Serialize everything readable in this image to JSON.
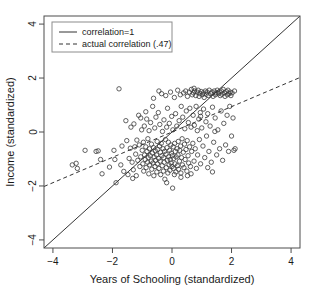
{
  "chart_data": {
    "type": "scatter",
    "title": "",
    "xlabel": "Years of Schooling (standardized)",
    "ylabel": "Income (standardized)",
    "xlim": [
      -4.3,
      4.3
    ],
    "ylim": [
      -4.3,
      4.3
    ],
    "xticks": [
      -4,
      -2,
      0,
      2,
      4
    ],
    "yticks": [
      -4,
      -2,
      0,
      2,
      4
    ],
    "xtick_labels": [
      "−4",
      "−2",
      "0",
      "2",
      "4"
    ],
    "ytick_labels": [
      "−4",
      "−2",
      "0",
      "2",
      "4"
    ],
    "grid": false,
    "legend_position": "top-left",
    "legend": [
      {
        "label": "correlation=1",
        "style": "solid"
      },
      {
        "label": "actual correlation (.47)",
        "style": "dashed"
      }
    ],
    "lines": [
      {
        "name": "correlation=1",
        "style": "solid",
        "slope": 1,
        "intercept": 0,
        "x": [
          -4.3,
          4.3
        ],
        "y": [
          -4.3,
          4.3
        ]
      },
      {
        "name": "actual correlation (.47)",
        "style": "dashed",
        "slope": 0.47,
        "intercept": 0,
        "x": [
          -4.3,
          4.3
        ],
        "y": [
          -2.02,
          2.02
        ]
      }
    ],
    "n_points": 252,
    "marker": "open-circle",
    "marker_color": "#3a3a3a",
    "points": [
      [
        -3.35,
        -1.22
      ],
      [
        -3.22,
        -1.16
      ],
      [
        -3.18,
        -1.35
      ],
      [
        -2.92,
        -0.68
      ],
      [
        -2.55,
        -0.72
      ],
      [
        -2.48,
        -0.7
      ],
      [
        -2.4,
        -1.02
      ],
      [
        -2.35,
        -1.55
      ],
      [
        -2.1,
        -1.3
      ],
      [
        -1.95,
        -0.68
      ],
      [
        -1.92,
        -1.02
      ],
      [
        -1.88,
        -1.88
      ],
      [
        -1.78,
        1.6
      ],
      [
        -1.72,
        -1.22
      ],
      [
        -1.68,
        -0.52
      ],
      [
        -1.62,
        -1.46
      ],
      [
        -1.55,
        0.42
      ],
      [
        -1.52,
        -0.32
      ],
      [
        -1.48,
        -1.58
      ],
      [
        -1.44,
        -0.98
      ],
      [
        -1.4,
        -0.6
      ],
      [
        -1.38,
        0.18
      ],
      [
        -1.34,
        -1.12
      ],
      [
        -1.3,
        -1.4
      ],
      [
        -1.28,
        0.3
      ],
      [
        -1.25,
        -0.55
      ],
      [
        -1.22,
        -0.82
      ],
      [
        -1.2,
        -1.62
      ],
      [
        -1.18,
        -0.3
      ],
      [
        -1.15,
        -1.05
      ],
      [
        -1.12,
        0.62
      ],
      [
        -1.1,
        -0.48
      ],
      [
        -1.08,
        -1.28
      ],
      [
        -1.05,
        -0.92
      ],
      [
        -1.02,
        0.08
      ],
      [
        -1.0,
        -0.68
      ],
      [
        -0.98,
        -1.18
      ],
      [
        -0.96,
        -0.38
      ],
      [
        -0.95,
        -1.45
      ],
      [
        -0.93,
        0.22
      ],
      [
        -0.92,
        -0.85
      ],
      [
        -0.9,
        -1.02
      ],
      [
        -0.88,
        -0.55
      ],
      [
        -0.87,
        -1.32
      ],
      [
        -0.85,
        0.48
      ],
      [
        -0.84,
        -0.72
      ],
      [
        -0.82,
        -1.12
      ],
      [
        -0.81,
        -0.25
      ],
      [
        -0.8,
        -0.95
      ],
      [
        -0.78,
        -1.55
      ],
      [
        -0.77,
        0.05
      ],
      [
        -0.76,
        -0.62
      ],
      [
        -0.75,
        -1.22
      ],
      [
        -0.73,
        -0.88
      ],
      [
        -0.72,
        0.35
      ],
      [
        -0.7,
        -1.08
      ],
      [
        -0.69,
        -0.45
      ],
      [
        -0.68,
        -1.38
      ],
      [
        -0.66,
        -0.78
      ],
      [
        -0.65,
        0.95
      ],
      [
        -0.64,
        -1.15
      ],
      [
        -0.62,
        -0.58
      ],
      [
        -0.61,
        -1.62
      ],
      [
        -0.6,
        -0.92
      ],
      [
        -0.58,
        0.15
      ],
      [
        -0.57,
        -1.28
      ],
      [
        -0.56,
        -0.7
      ],
      [
        -0.55,
        -1.05
      ],
      [
        -0.54,
        0.55
      ],
      [
        -0.52,
        -0.85
      ],
      [
        -0.51,
        -1.48
      ],
      [
        -0.5,
        -0.35
      ],
      [
        -0.49,
        -1.18
      ],
      [
        -0.48,
        -0.65
      ],
      [
        -0.46,
        0.72
      ],
      [
        -0.45,
        -0.98
      ],
      [
        -0.44,
        -1.35
      ],
      [
        -0.42,
        -0.52
      ],
      [
        -0.41,
        0.28
      ],
      [
        -0.4,
        -1.08
      ],
      [
        -0.39,
        -0.75
      ],
      [
        -0.38,
        -1.58
      ],
      [
        -0.36,
        -0.42
      ],
      [
        -0.35,
        1.42
      ],
      [
        -0.34,
        -0.88
      ],
      [
        -0.33,
        -1.25
      ],
      [
        -0.32,
        0.02
      ],
      [
        -0.3,
        -0.62
      ],
      [
        -0.29,
        -1.45
      ],
      [
        -0.28,
        -0.95
      ],
      [
        -0.27,
        0.45
      ],
      [
        -0.26,
        -1.12
      ],
      [
        -0.25,
        -0.72
      ],
      [
        -0.24,
        -1.75
      ],
      [
        -0.22,
        -0.28
      ],
      [
        -0.21,
        1.35
      ],
      [
        -0.2,
        -0.82
      ],
      [
        -0.19,
        -1.32
      ],
      [
        -0.18,
        0.18
      ],
      [
        -0.17,
        -0.58
      ],
      [
        -0.16,
        -1.05
      ],
      [
        -0.15,
        0.88
      ],
      [
        -0.14,
        -1.52
      ],
      [
        -0.12,
        -0.38
      ],
      [
        -0.11,
        -0.92
      ],
      [
        -0.1,
        -1.22
      ],
      [
        -0.09,
        0.32
      ],
      [
        -0.08,
        -0.68
      ],
      [
        -0.07,
        -1.42
      ],
      [
        -0.06,
        -1.02
      ],
      [
        -0.05,
        1.48
      ],
      [
        -0.04,
        -0.48
      ],
      [
        -0.03,
        -1.15
      ],
      [
        -0.02,
        -0.78
      ],
      [
        -0.01,
        0.58
      ],
      [
        0.0,
        -1.28
      ],
      [
        0.01,
        -0.88
      ],
      [
        0.02,
        -2.08
      ],
      [
        0.03,
        0.08
      ],
      [
        0.04,
        -0.55
      ],
      [
        0.05,
        -1.35
      ],
      [
        0.06,
        -0.98
      ],
      [
        0.08,
        1.28
      ],
      [
        0.09,
        -0.42
      ],
      [
        0.1,
        -1.18
      ],
      [
        0.11,
        -0.72
      ],
      [
        0.12,
        0.68
      ],
      [
        0.13,
        -1.48
      ],
      [
        0.14,
        -0.92
      ],
      [
        0.16,
        0.22
      ],
      [
        0.17,
        -0.62
      ],
      [
        0.18,
        -1.25
      ],
      [
        0.19,
        1.55
      ],
      [
        0.2,
        -0.85
      ],
      [
        0.21,
        -0.35
      ],
      [
        0.22,
        -1.38
      ],
      [
        0.24,
        0.42
      ],
      [
        0.25,
        -1.08
      ],
      [
        0.26,
        -0.68
      ],
      [
        0.28,
        1.38
      ],
      [
        0.29,
        -0.52
      ],
      [
        0.3,
        -1.52
      ],
      [
        0.31,
        0.95
      ],
      [
        0.32,
        -0.95
      ],
      [
        0.34,
        -0.25
      ],
      [
        0.35,
        -1.22
      ],
      [
        0.36,
        0.55
      ],
      [
        0.38,
        -0.75
      ],
      [
        0.39,
        1.45
      ],
      [
        0.4,
        -1.32
      ],
      [
        0.42,
        -0.45
      ],
      [
        0.43,
        0.12
      ],
      [
        0.44,
        -1.02
      ],
      [
        0.46,
        1.52
      ],
      [
        0.47,
        -0.65
      ],
      [
        0.48,
        0.78
      ],
      [
        0.5,
        -1.45
      ],
      [
        0.51,
        -0.32
      ],
      [
        0.52,
        1.32
      ],
      [
        0.54,
        -0.88
      ],
      [
        0.55,
        0.35
      ],
      [
        0.56,
        -1.15
      ],
      [
        0.58,
        1.48
      ],
      [
        0.59,
        -0.55
      ],
      [
        0.6,
        0.88
      ],
      [
        0.62,
        -1.28
      ],
      [
        0.64,
        0.18
      ],
      [
        0.65,
        1.58
      ],
      [
        0.66,
        -0.72
      ],
      [
        0.68,
        1.38
      ],
      [
        0.7,
        -0.42
      ],
      [
        0.71,
        0.62
      ],
      [
        0.72,
        1.45
      ],
      [
        0.74,
        -1.08
      ],
      [
        0.75,
        0.25
      ],
      [
        0.76,
        1.52
      ],
      [
        0.78,
        -0.62
      ],
      [
        0.8,
        1.35
      ],
      [
        0.81,
        0.95
      ],
      [
        0.82,
        -1.35
      ],
      [
        0.84,
        1.48
      ],
      [
        0.85,
        0.05
      ],
      [
        0.86,
        -0.85
      ],
      [
        0.88,
        1.55
      ],
      [
        0.9,
        0.48
      ],
      [
        0.91,
        1.32
      ],
      [
        0.92,
        -0.28
      ],
      [
        0.94,
        1.42
      ],
      [
        0.95,
        0.72
      ],
      [
        0.96,
        -1.18
      ],
      [
        0.98,
        1.5
      ],
      [
        1.0,
        0.15
      ],
      [
        1.02,
        1.38
      ],
      [
        1.04,
        -0.52
      ],
      [
        1.05,
        1.45
      ],
      [
        1.06,
        0.85
      ],
      [
        1.08,
        1.28
      ],
      [
        1.1,
        -0.95
      ],
      [
        1.12,
        1.52
      ],
      [
        1.14,
        0.38
      ],
      [
        1.15,
        1.4
      ],
      [
        1.16,
        -0.15
      ],
      [
        1.18,
        1.48
      ],
      [
        1.2,
        0.68
      ],
      [
        1.22,
        1.35
      ],
      [
        1.24,
        -0.72
      ],
      [
        1.25,
        1.55
      ],
      [
        1.28,
        0.22
      ],
      [
        1.3,
        1.42
      ],
      [
        1.32,
        -1.12
      ],
      [
        1.34,
        1.48
      ],
      [
        1.36,
        0.92
      ],
      [
        1.38,
        1.32
      ],
      [
        1.4,
        -0.38
      ],
      [
        1.42,
        1.52
      ],
      [
        1.45,
        0.52
      ],
      [
        1.46,
        1.38
      ],
      [
        1.48,
        1.45
      ],
      [
        1.5,
        -0.85
      ],
      [
        1.52,
        1.55
      ],
      [
        1.54,
        0.08
      ],
      [
        1.56,
        1.42
      ],
      [
        1.58,
        1.48
      ],
      [
        1.6,
        -0.62
      ],
      [
        1.62,
        1.35
      ],
      [
        1.65,
        0.78
      ],
      [
        1.66,
        1.52
      ],
      [
        1.68,
        1.4
      ],
      [
        1.7,
        -1.05
      ],
      [
        1.72,
        1.58
      ],
      [
        1.74,
        0.32
      ],
      [
        1.76,
        1.45
      ],
      [
        1.78,
        1.32
      ],
      [
        1.8,
        -0.48
      ],
      [
        1.82,
        1.5
      ],
      [
        1.85,
        0.62
      ],
      [
        1.86,
        1.38
      ],
      [
        1.88,
        1.55
      ],
      [
        1.9,
        -0.72
      ],
      [
        1.92,
        1.42
      ],
      [
        1.94,
        0.95
      ],
      [
        1.95,
        1.48
      ],
      [
        1.98,
        1.35
      ],
      [
        2.0,
        -0.15
      ],
      [
        2.02,
        1.45
      ],
      [
        2.05,
        0.52
      ],
      [
        2.08,
        -0.68
      ],
      [
        2.1,
        1.52
      ],
      [
        2.12,
        -0.62
      ],
      [
        1.44,
        0.02
      ],
      [
        1.36,
        -1.48
      ],
      [
        1.2,
        -1.32
      ],
      [
        0.96,
        0.58
      ],
      [
        0.74,
        1.62
      ],
      [
        0.52,
        -1.62
      ],
      [
        0.3,
        -1.68
      ],
      [
        0.08,
        -1.58
      ],
      [
        -0.44,
        1.52
      ],
      [
        -0.62,
        1.25
      ],
      [
        -0.88,
        0.75
      ],
      [
        -1.05,
        0.52
      ],
      [
        -1.32,
        -1.72
      ],
      [
        -0.18,
        -1.88
      ],
      [
        0.64,
        -1.55
      ]
    ]
  }
}
